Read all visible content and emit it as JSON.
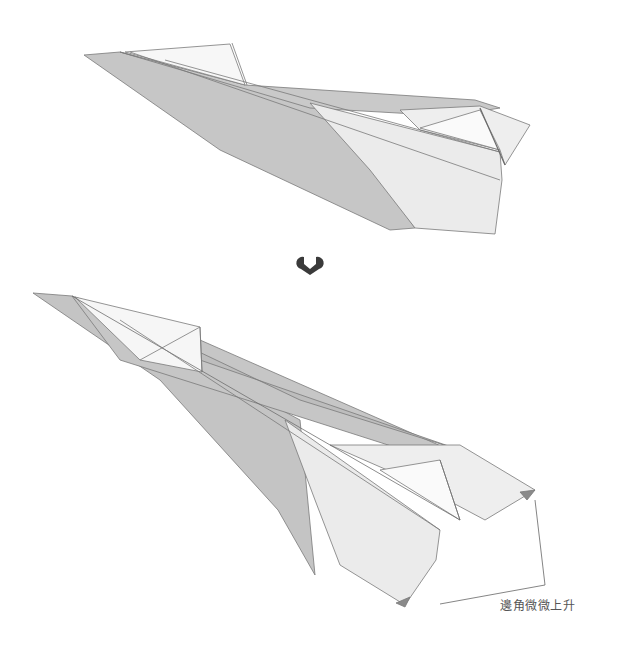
{
  "diagram": {
    "type": "folding-instruction",
    "steps": [
      {
        "name": "before",
        "description": "Paper airplane, wing tips flat"
      },
      {
        "name": "after",
        "description": "Paper airplane, wing tip corners raised slightly"
      }
    ],
    "transition_icon": "down-arrow-icon",
    "annotation": {
      "text": "邊角微微上升",
      "points_to": "wing tip corners"
    },
    "colors": {
      "background": "#ffffff",
      "paper_light": "#ebebeb",
      "paper_white": "#f7f7f7",
      "paper_shadow": "#c4c4c4",
      "paper_dark": "#b3b3b3",
      "edge": "#7a7a7a",
      "arrow": "#3a3a3a",
      "label_text": "#555555"
    }
  }
}
